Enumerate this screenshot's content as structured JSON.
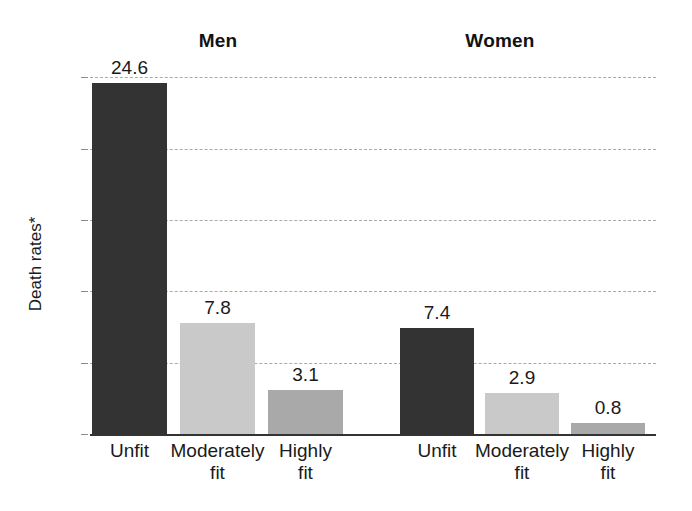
{
  "figure": {
    "background_color": "#ffffff",
    "y_axis_title": "Death rates*",
    "group_titles": {
      "men": "Men",
      "women": "Women"
    }
  },
  "chart_data": {
    "type": "bar",
    "title": "",
    "xlabel": "",
    "ylabel": "Death rates*",
    "ylim": [
      0,
      26
    ],
    "yticks": [
      0,
      5,
      10,
      15,
      20,
      25
    ],
    "ytick_labels": [
      "0",
      "5",
      "10",
      "15",
      "20",
      "25"
    ],
    "grid": true,
    "grid_style": "dashed",
    "grid_color": "#a9a9a9",
    "legend": "none",
    "groups": [
      "Men",
      "Women"
    ],
    "categories": [
      "Unfit",
      "Moderately fit",
      "Highly fit"
    ],
    "category_label_lines": [
      [
        "Unfit",
        ""
      ],
      [
        "Moderately",
        "fit"
      ],
      [
        "Highly",
        "fit"
      ]
    ],
    "series": [
      {
        "name": "Men",
        "values": [
          24.6,
          7.8,
          3.1
        ]
      },
      {
        "name": "Women",
        "values": [
          7.4,
          2.9,
          0.8
        ]
      }
    ],
    "bars": [
      {
        "group": "Men",
        "category": "Unfit",
        "value": 24.6,
        "label": "24.6",
        "color": "#333333",
        "shade": "dark"
      },
      {
        "group": "Men",
        "category": "Moderately fit",
        "value": 7.8,
        "label": "7.8",
        "color": "#c9c9c9",
        "shade": "light"
      },
      {
        "group": "Men",
        "category": "Highly fit",
        "value": 3.1,
        "label": "3.1",
        "color": "#a9a9a9",
        "shade": "medium"
      },
      {
        "group": "Women",
        "category": "Unfit",
        "value": 7.4,
        "label": "7.4",
        "color": "#333333",
        "shade": "dark"
      },
      {
        "group": "Women",
        "category": "Moderately fit",
        "value": 2.9,
        "label": "2.9",
        "color": "#c9c9c9",
        "shade": "light"
      },
      {
        "group": "Women",
        "category": "Highly fit",
        "value": 0.8,
        "label": "0.8",
        "color": "#a9a9a9",
        "shade": "medium"
      }
    ]
  }
}
